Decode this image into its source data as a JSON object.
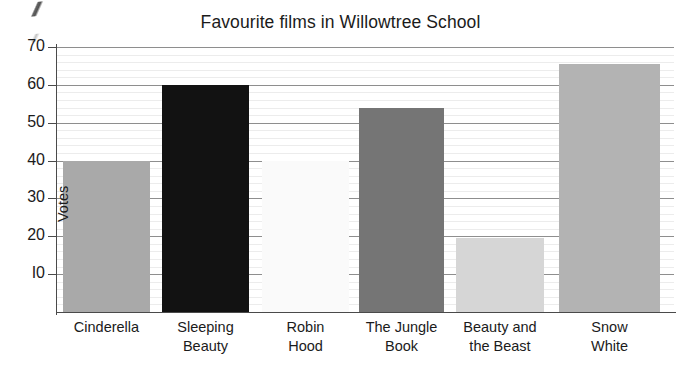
{
  "chart_data": {
    "type": "bar",
    "title": "Favourite films in Willowtree School",
    "xlabel": "",
    "ylabel": "Votes",
    "ylim": [
      0,
      70
    ],
    "ytick_values": [
      70,
      60,
      50,
      40,
      30,
      20,
      10
    ],
    "ytick_labels": [
      "70",
      "60",
      "50",
      "40",
      "30",
      "20",
      "I0"
    ],
    "grid": "horizontal-major-and-minor",
    "legend": "none",
    "categories": [
      "Cinderella",
      "Sleeping Beauty",
      "Robin Hood",
      "The Jungle Book",
      "Beauty and the Beast",
      "Snow White"
    ],
    "category_label_lines": [
      [
        "Cinderella"
      ],
      [
        "Sleeping",
        "Beauty"
      ],
      [
        "Robin",
        "Hood"
      ],
      [
        "The Jungle",
        "Book"
      ],
      [
        "Beauty and",
        "the Beast"
      ],
      [
        "Snow",
        "White"
      ]
    ],
    "values": [
      40,
      60,
      40,
      54,
      19.5,
      65.5
    ],
    "bar_colors": [
      "#a9a9a9",
      "#121212",
      "#fafafa",
      "#757575",
      "#d6d6d6",
      "#b3b3b3"
    ],
    "bars": [
      {
        "category": "Cinderella",
        "value": 40,
        "color": "#a9a9a9"
      },
      {
        "category": "Sleeping Beauty",
        "value": 60,
        "color": "#121212"
      },
      {
        "category": "Robin Hood",
        "value": 40,
        "color": "#fafafa"
      },
      {
        "category": "The Jungle Book",
        "value": 54,
        "color": "#757575"
      },
      {
        "category": "Beauty and the Beast",
        "value": 19.5,
        "color": "#d6d6d6"
      },
      {
        "category": "Snow White",
        "value": 65.5,
        "color": "#b3b3b3"
      }
    ]
  },
  "axis_colors": {
    "axis_line": "#4a4a4a",
    "major_gridline": "#8e8e8e",
    "minor_gridline": "#ececec",
    "text": "#1b1b1b",
    "background": "#ffffff"
  }
}
